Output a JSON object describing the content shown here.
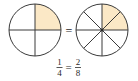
{
  "figure": {
    "fill_color": "#fbe8c6",
    "stroke_color": "#3a3a3a",
    "left_circle": {
      "parts": 4,
      "shaded": 1
    },
    "right_circle": {
      "parts": 8,
      "shaded": 2
    },
    "between_symbol": "=",
    "equation": {
      "left": {
        "numerator": "1",
        "denominator": "4"
      },
      "equals": "=",
      "right": {
        "numerator": "2",
        "denominator": "8"
      }
    }
  }
}
